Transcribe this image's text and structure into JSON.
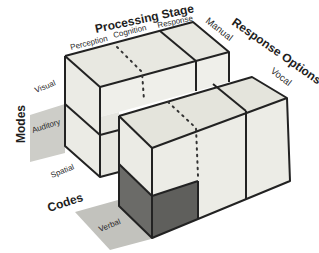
{
  "diagram": {
    "type": "multiple-resource-model-cube",
    "axes": {
      "processing_stage": {
        "title": "Processing Stage",
        "levels": [
          "Perception",
          "Cognition",
          "Response"
        ]
      },
      "response_options": {
        "title": "Response Options",
        "levels": [
          "Manual",
          "Vocal"
        ]
      },
      "modes": {
        "title": "Modes",
        "levels": [
          "Visual",
          "Auditory"
        ]
      },
      "codes": {
        "title": "Codes",
        "levels": [
          "Spatial",
          "Verbal"
        ]
      }
    },
    "colors": {
      "face_light": "#ecece6",
      "face_top": "#e4e4dc",
      "face_dark": "#6b6b68",
      "face_dark_side": "#5e5e5b",
      "shadow_gray": "#c9c9c4",
      "edge": "#222222"
    }
  }
}
